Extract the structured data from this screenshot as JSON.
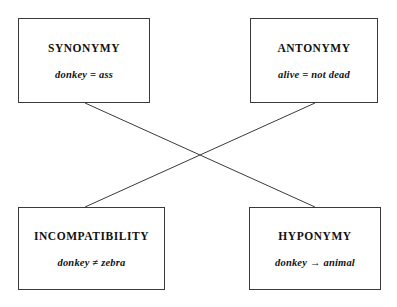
{
  "diagram": {
    "type": "sense-relations-diagram",
    "background_color": "#ffffff",
    "line_color": "#3a3a3a",
    "boxes": [
      {
        "id": "synonymy",
        "title": "SYNONYMY",
        "formula": "donkey = ass"
      },
      {
        "id": "antonymy",
        "title": "ANTONYMY",
        "formula": "alive = not dead"
      },
      {
        "id": "incompatibility",
        "title": "INCOMPATIBILITY",
        "formula": "donkey ≠ zebra"
      },
      {
        "id": "hyponymy",
        "title": "HYPONYMY",
        "formula": "donkey → animal"
      }
    ],
    "connectors": [
      {
        "id": "synonymy-to-hyponymy",
        "from": "synonymy",
        "to": "hyponymy"
      },
      {
        "id": "antonymy-to-incompatibility",
        "from": "antonymy",
        "to": "incompatibility"
      }
    ]
  }
}
